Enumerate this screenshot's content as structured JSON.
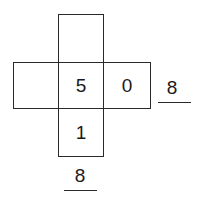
{
  "net": {
    "top": "",
    "left": "",
    "center": "5",
    "right": "0",
    "bottom": "1"
  },
  "answers": {
    "right": "8",
    "bottom": "8"
  },
  "colors": {
    "line": "#2a2a2a",
    "text": "#1a1a1a"
  }
}
